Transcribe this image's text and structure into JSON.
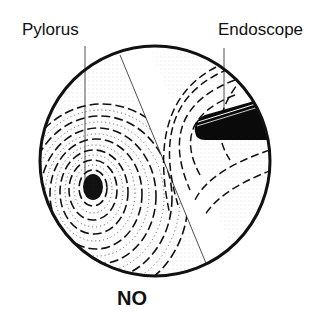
{
  "figure": {
    "labels": {
      "pylorus": "Pylorus",
      "endoscope": "Endoscope",
      "verdict": "NO"
    },
    "colors": {
      "ink": "#111111",
      "background": "#ffffff"
    },
    "icons": {
      "view": "endoscopic-view-circle",
      "pylorus": "pylorus-dark-spot",
      "endoscope": "endoscope-tip-black-bar"
    }
  }
}
